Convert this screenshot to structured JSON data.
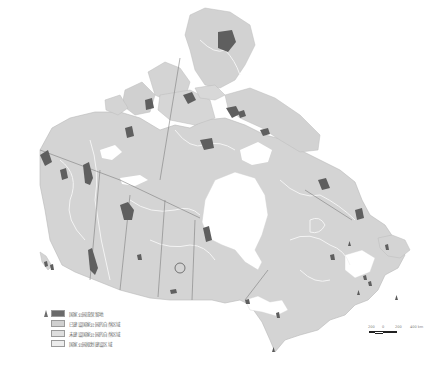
{
  "map": {
    "subject": "Canada national parks and natural regions",
    "colors": {
      "background": "#ffffff",
      "land": "#d4d4d4",
      "land_alt": "#c6c6c6",
      "park": "#5f5f5f",
      "water": "#ffffff",
      "border": "#7a7a7a",
      "region_line": "#f2f2f2"
    }
  },
  "legend": {
    "items": [
      {
        "label": "国家公园或保留地",
        "swatch": "#6a6a6a",
        "marker": "triangle"
      },
      {
        "label": "已建设国家公园的自然区域",
        "swatch": "#d0d0d0"
      },
      {
        "label": "未建设国家公园的自然区域",
        "swatch": "#dedede"
      },
      {
        "label": "国家公园规划建设区域",
        "swatch": "#ececec"
      }
    ]
  },
  "scale_bar": {
    "labels": [
      "200",
      "0",
      "200",
      "400 km"
    ]
  }
}
